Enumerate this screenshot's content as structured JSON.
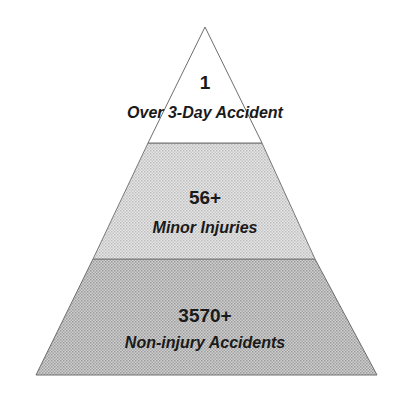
{
  "diagram": {
    "type": "pyramid",
    "tiers": [
      {
        "position": "top",
        "count": "1",
        "label": "Over 3-Day Accident",
        "fill": "#ffffff"
      },
      {
        "position": "middle",
        "count": "56+",
        "label": "Minor Injuries",
        "fill": "#d9d9d9"
      },
      {
        "position": "bottom",
        "count": "3570+",
        "label": "Non-injury Accidents",
        "fill": "#bdbdbd"
      }
    ],
    "colors": {
      "outline": "#6e6e6e",
      "text": "#1a1a1a"
    }
  }
}
